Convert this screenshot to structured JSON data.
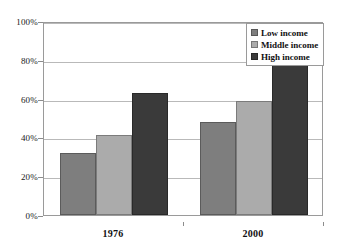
{
  "chart_data": {
    "type": "bar",
    "title": "",
    "subtitle": "",
    "xlabel": "",
    "ylabel": "",
    "categories": [
      "1976",
      "2000"
    ],
    "series": [
      {
        "name": "Low income",
        "color": "#7e7e7e",
        "values": [
          32,
          48
        ]
      },
      {
        "name": "Middle income",
        "color": "#ababab",
        "values": [
          41,
          59
        ]
      },
      {
        "name": "High income",
        "color": "#3a3a3a",
        "values": [
          63,
          78
        ]
      }
    ],
    "ylim": [
      0,
      100
    ],
    "y_ticks": [
      0,
      20,
      40,
      60,
      80,
      100
    ],
    "y_tick_labels": [
      "0%",
      "20%",
      "40%",
      "60%",
      "80%",
      "100%"
    ],
    "value_suffix": "%",
    "grid": true,
    "legend_position": "top-right",
    "annotations": []
  },
  "legend": {
    "items": [
      {
        "label": "Low income",
        "swatch": "legend-swatch-low-income"
      },
      {
        "label": "Middle income",
        "swatch": "legend-swatch-middle-income"
      },
      {
        "label": "High income",
        "swatch": "legend-swatch-high-income"
      }
    ]
  },
  "colors": {
    "low_income": "#7e7e7e",
    "middle_income": "#ababab",
    "high_income": "#3a3a3a",
    "gridline": "#b9b9b9",
    "frame": "#9a9a9a",
    "text": "#111111",
    "background": "#ffffff"
  }
}
